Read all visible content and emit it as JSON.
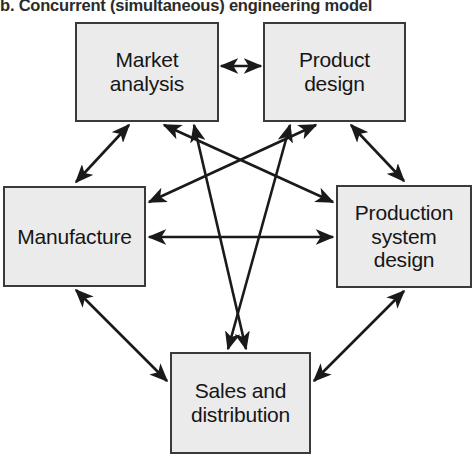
{
  "figure": {
    "caption": "b. Concurrent (simultaneous) engineering model",
    "type": "diagram",
    "diagram_kind": "network",
    "colors": {
      "node_fill": "#ebebeb",
      "node_border": "#3a3a3a",
      "edge": "#1a1a1a",
      "text": "#161616",
      "background": "#ffffff"
    }
  },
  "nodes": [
    {
      "id": "market_analysis",
      "label": "Market analysis",
      "lines": [
        "Market",
        "analysis"
      ],
      "position": "top-left"
    },
    {
      "id": "product_design",
      "label": "Product design",
      "lines": [
        "Product",
        "design"
      ],
      "position": "top-right"
    },
    {
      "id": "manufacture",
      "label": "Manufacture",
      "lines": [
        "Manufacture"
      ],
      "position": "middle-left"
    },
    {
      "id": "production_system_design",
      "label": "Production system design",
      "lines": [
        "Production",
        "system",
        "design"
      ],
      "position": "middle-right"
    },
    {
      "id": "sales_and_distribution",
      "label": "Sales and distribution",
      "lines": [
        "Sales and",
        "distribution"
      ],
      "position": "bottom-center"
    }
  ],
  "edges": [
    {
      "from": "market_analysis",
      "to": "product_design",
      "arrow": "double"
    },
    {
      "from": "market_analysis",
      "to": "manufacture",
      "arrow": "double"
    },
    {
      "from": "product_design",
      "to": "production_system_design",
      "arrow": "double"
    },
    {
      "from": "manufacture",
      "to": "production_system_design",
      "arrow": "double"
    },
    {
      "from": "market_analysis",
      "to": "production_system_design",
      "arrow": "double"
    },
    {
      "from": "product_design",
      "to": "manufacture",
      "arrow": "double"
    },
    {
      "from": "market_analysis",
      "to": "sales_and_distribution",
      "arrow": "double"
    },
    {
      "from": "product_design",
      "to": "sales_and_distribution",
      "arrow": "double"
    },
    {
      "from": "manufacture",
      "to": "sales_and_distribution",
      "arrow": "double"
    },
    {
      "from": "production_system_design",
      "to": "sales_and_distribution",
      "arrow": "double"
    }
  ]
}
